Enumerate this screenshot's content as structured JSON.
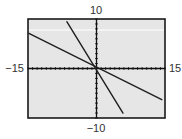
{
  "chart_data": {
    "type": "line",
    "title": "",
    "xlabel": "",
    "ylabel": "",
    "xlim": [
      -15,
      15
    ],
    "ylim": [
      -10,
      10
    ],
    "xscl": 1,
    "yscl": 1,
    "grid": false,
    "legend": null,
    "tick_labels": {
      "xmin": "−15",
      "xmax": "15",
      "ymin": "−10",
      "ymax": "10"
    },
    "series": [
      {
        "name": "steep-line",
        "slope": -1.5,
        "intercept": -0.3,
        "x": [
          -6.5,
          5.8
        ],
        "y": [
          9.45,
          -9.0
        ]
      },
      {
        "name": "shallow-line",
        "slope": -0.46,
        "intercept": 0.3,
        "x": [
          -14.8,
          14.3
        ],
        "y": [
          7.11,
          -6.28
        ]
      }
    ]
  },
  "style": {
    "screen_bg": "#e6e6e6",
    "frame_color": "#1a1a1a",
    "line_color": "#1f1f1f",
    "axis_color": "#111111",
    "highlight_color": "#ffffff"
  }
}
